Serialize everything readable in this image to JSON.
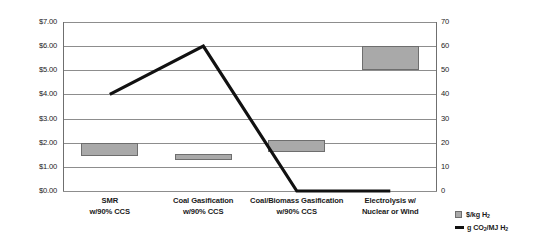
{
  "chart_data": {
    "type": "bar",
    "title": "",
    "subtitle": "",
    "xlabel": "",
    "categories": [
      "SMR\nw/90% CCS",
      "Coal Gasification\nw/90% CCS",
      "Coal/Biomass Gasification\nw/90% CCS",
      "Electrolysis w/\nNuclear or Wind"
    ],
    "category_lines": [
      [
        "SMR",
        "w/90% CCS"
      ],
      [
        "Coal Gasification",
        "w/90% CCS"
      ],
      [
        "Coal/Biomass Gasification",
        "w/90% CCS"
      ],
      [
        "Electrolysis w/",
        "Nuclear or Wind"
      ]
    ],
    "grid": true,
    "legend_position": "bottom-right",
    "left_axis": {
      "label": "",
      "ylim": [
        0,
        7
      ],
      "tick_step": 1,
      "ticks": [
        "$0.00",
        "$1.00",
        "$2.00",
        "$3.00",
        "$4.00",
        "$5.00",
        "$6.00",
        "$7.00"
      ],
      "tick_values": [
        0,
        1,
        2,
        3,
        4,
        5,
        6,
        7
      ]
    },
    "right_axis": {
      "label": "Grams CO2/MJ H2",
      "label_parts": [
        "Grams CO",
        "2",
        "/MJ H",
        "2"
      ],
      "ylim": [
        0,
        70
      ],
      "tick_step": 10,
      "ticks": [
        "0",
        "10",
        "20",
        "30",
        "40",
        "50",
        "60",
        "70"
      ],
      "tick_values": [
        0,
        10,
        20,
        30,
        40,
        50,
        60,
        70
      ]
    },
    "series": [
      {
        "name": "$/kg H2",
        "type": "range-bar",
        "axis": "left",
        "units": "$/kg H2",
        "color": "#a9a9a9",
        "values": [
          {
            "category": "SMR w/90% CCS",
            "low": 1.45,
            "high": 2.0
          },
          {
            "category": "Coal Gasification w/90% CCS",
            "low": 1.27,
            "high": 1.55
          },
          {
            "category": "Coal/Biomass Gasification w/90% CCS",
            "low": 1.6,
            "high": 2.1
          },
          {
            "category": "Electrolysis w/ Nuclear or Wind",
            "low": 5.0,
            "high": 6.0
          }
        ]
      },
      {
        "name": "g CO2/MJ H2",
        "type": "line",
        "axis": "right",
        "units": "g CO2/MJ H2",
        "color": "#111111",
        "values": [
          40,
          60,
          0,
          0
        ]
      }
    ]
  },
  "legend": {
    "items": [
      {
        "marker": "box-swatch",
        "label_parts": [
          "$/kg H",
          "2"
        ]
      },
      {
        "marker": "line-swatch",
        "label_parts": [
          "g CO",
          "2",
          "/MJ H",
          "2"
        ]
      }
    ]
  }
}
